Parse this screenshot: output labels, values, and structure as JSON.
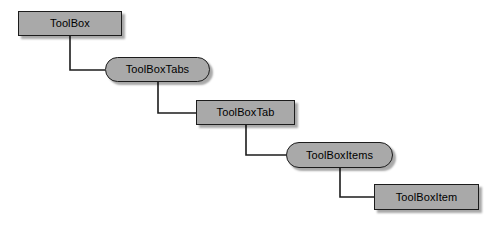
{
  "diagram": {
    "type": "containment-hierarchy",
    "palette": {
      "node_fill": "#a9a9a9",
      "node_border": "#1c1c1c",
      "node_text": "#000000",
      "connector": "#1c1c1c",
      "background": "#ffffff"
    },
    "nodes": [
      {
        "id": "toolbox",
        "label": "ToolBox",
        "shape": "rect",
        "x": 18,
        "y": 11,
        "width": 104,
        "height": 25
      },
      {
        "id": "toolboxtabs",
        "label": "ToolBoxTabs",
        "shape": "pill",
        "x": 105,
        "y": 57,
        "width": 105,
        "height": 25
      },
      {
        "id": "toolboxtab",
        "label": "ToolBoxTab",
        "shape": "rect",
        "x": 196,
        "y": 100,
        "width": 99,
        "height": 25
      },
      {
        "id": "toolboxitems",
        "label": "ToolBoxItems",
        "shape": "pill",
        "x": 286,
        "y": 142,
        "width": 107,
        "height": 26
      },
      {
        "id": "toolboxitem",
        "label": "ToolBoxItem",
        "shape": "rect",
        "x": 374,
        "y": 184,
        "width": 105,
        "height": 26
      }
    ],
    "connectors": [
      {
        "id": "toolbox-to-toolboxtabs",
        "from": "toolbox",
        "to": "toolboxtabs",
        "path": "M 70 36 L 70 70 L 105 70"
      },
      {
        "id": "toolboxtabs-to-toolboxtab",
        "from": "toolboxtabs",
        "to": "toolboxtab",
        "path": "M 158 82 L 158 113 L 196 113"
      },
      {
        "id": "toolboxtab-to-toolboxitems",
        "from": "toolboxtab",
        "to": "toolboxitems",
        "path": "M 246 125 L 246 155 L 286 155"
      },
      {
        "id": "toolboxitems-to-toolboxitem",
        "from": "toolboxitems",
        "to": "toolboxitem",
        "path": "M 340 168 L 340 197 L 374 197"
      }
    ]
  }
}
